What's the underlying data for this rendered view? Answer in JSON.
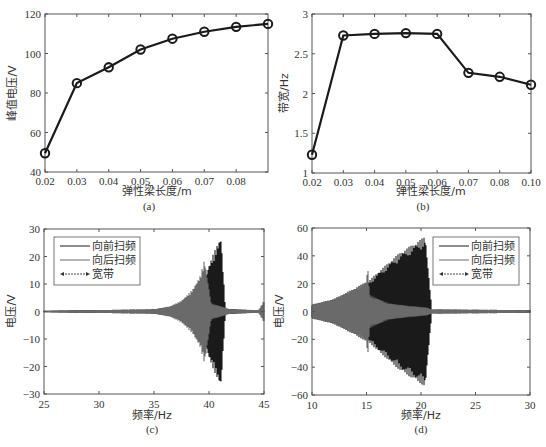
{
  "chart_data": [
    {
      "id": "a",
      "type": "line",
      "caption": "(a)",
      "xlabel": "弹性梁长度/m",
      "ylabel": "峰值电压/V",
      "x": [
        0.02,
        0.03,
        0.04,
        0.05,
        0.06,
        0.07,
        0.08,
        0.09
      ],
      "values": [
        49.5,
        85,
        93,
        102,
        107.5,
        111,
        113.5,
        115
      ],
      "xticks": [
        "0.02",
        "0.03",
        "0.04",
        "0.05",
        "0.06",
        "0.07",
        "0.08"
      ],
      "yticks": [
        "40",
        "60",
        "80",
        "100",
        "120"
      ],
      "xlim": [
        0.02,
        0.09
      ],
      "ylim": [
        40,
        120
      ],
      "marker": "circle",
      "grid": false
    },
    {
      "id": "b",
      "type": "line",
      "caption": "(b)",
      "xlabel": "弹性梁长度/m",
      "ylabel": "带宽/Hz",
      "x": [
        0.02,
        0.03,
        0.04,
        0.05,
        0.06,
        0.07,
        0.08,
        0.1
      ],
      "categories": [
        "0.02",
        "0.03",
        "0.04",
        "0.05",
        "0.06",
        "0.07",
        "0.08",
        "0.10"
      ],
      "values": [
        1.23,
        2.73,
        2.75,
        2.76,
        2.75,
        2.26,
        2.21,
        2.11
      ],
      "xticks": [
        "0.02",
        "0.03",
        "0.04",
        "0.05",
        "0.06",
        "0.07",
        "0.08",
        "0.10"
      ],
      "yticks": [
        "1",
        "1.5",
        "2",
        "2.5",
        "3"
      ],
      "ylim": [
        1,
        3
      ],
      "marker": "circle",
      "grid": false
    },
    {
      "id": "c",
      "type": "area",
      "caption": "(c)",
      "xlabel": "频率/Hz",
      "ylabel": "电压/V",
      "xticks": [
        "25",
        "30",
        "35",
        "40",
        "45"
      ],
      "yticks": [
        "30",
        "20",
        "10",
        "0",
        "−10",
        "−20",
        "−30"
      ],
      "xlim": [
        25,
        45
      ],
      "ylim": [
        -30,
        30
      ],
      "legend": [
        "向前扫频",
        "向后扫频",
        "宽带"
      ],
      "legend_position": "upper left",
      "series": [
        {
          "name": "向前扫频",
          "color": "#1a1a1a",
          "envelope_x": [
            25,
            35,
            37,
            38.5,
            39.5,
            40,
            40.5,
            41,
            41.1,
            41.5,
            45
          ],
          "envelope_amp": [
            0.3,
            0.8,
            2,
            5,
            10,
            17,
            22,
            26.5,
            27,
            1,
            0.3
          ]
        },
        {
          "name": "向后扫频",
          "color": "#6a6a6a",
          "envelope_x": [
            25,
            35,
            36.5,
            37.5,
            38.5,
            39.2,
            39.6,
            40.2,
            41,
            42,
            44.5,
            45
          ],
          "envelope_amp": [
            0.3,
            0.8,
            2,
            4,
            8,
            13,
            19,
            3,
            2,
            0.8,
            0.5,
            4
          ]
        },
        {
          "name": "宽带",
          "annotation": "double arrow"
        }
      ]
    },
    {
      "id": "d",
      "type": "area",
      "caption": "(d)",
      "xlabel": "频率/Hz",
      "ylabel": "电压/V",
      "xticks": [
        "10",
        "15",
        "20",
        "25",
        "30"
      ],
      "yticks": [
        "60",
        "40",
        "20",
        "0",
        "−20",
        "−40",
        "−60"
      ],
      "xlim": [
        10,
        30
      ],
      "ylim": [
        -60,
        60
      ],
      "legend": [
        "向前扫频",
        "向后扫频",
        "宽带"
      ],
      "legend_position": "upper right",
      "series": [
        {
          "name": "向前扫频",
          "color": "#1a1a1a",
          "envelope_x": [
            10,
            12,
            14,
            15.2,
            16,
            18,
            20,
            20.4,
            21,
            30
          ],
          "envelope_amp": [
            5,
            9,
            17,
            22,
            28,
            42,
            52,
            54,
            1.5,
            1
          ]
        },
        {
          "name": "向后扫频",
          "color": "#6a6a6a",
          "envelope_x": [
            10,
            12,
            14,
            15,
            15.1,
            15.3,
            17,
            19,
            20.5,
            21,
            30
          ],
          "envelope_amp": [
            5,
            9,
            17,
            22,
            34,
            12,
            6,
            4,
            3,
            1.5,
            1
          ]
        },
        {
          "name": "宽带",
          "annotation": "double arrow"
        }
      ]
    }
  ],
  "figure": {
    "captions": [
      "(a)",
      "(b)",
      "(c)",
      "(d)"
    ],
    "line_color": "#1a1a1a",
    "secondary_color": "#6a6a6a",
    "axis_color": "#555555"
  }
}
